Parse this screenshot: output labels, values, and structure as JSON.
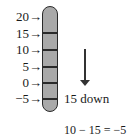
{
  "diagram": {
    "scale_labels": [
      "20→",
      "15→",
      "10→",
      "5→",
      "0→",
      "−5→"
    ],
    "scale_values": [
      20,
      15,
      10,
      5,
      0,
      -5
    ],
    "movement": {
      "direction": "down",
      "amount": 15,
      "label": "15 down"
    },
    "equation": "10 − 15 = −5",
    "colors": {
      "thermometer_fill": "#a9a9a9",
      "outline": "#2a2a2a"
    }
  }
}
